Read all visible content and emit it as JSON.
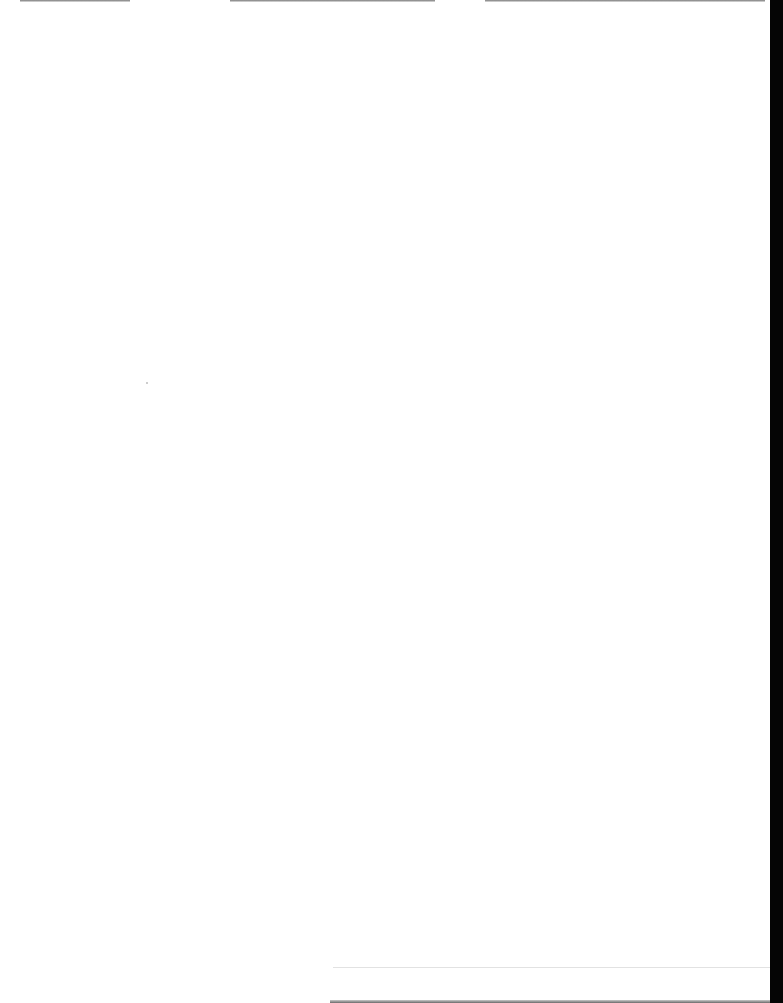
{
  "page": {
    "content": "",
    "background_color": "#ffffff",
    "edge_color": "#050505"
  }
}
